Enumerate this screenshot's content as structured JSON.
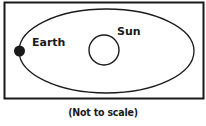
{
  "diagram": {
    "labels": {
      "earth": "Earth",
      "sun": "Sun"
    },
    "caption": "(Not to scale)",
    "colors": {
      "stroke": "#1a1a1a",
      "background": "#ffffff"
    }
  }
}
